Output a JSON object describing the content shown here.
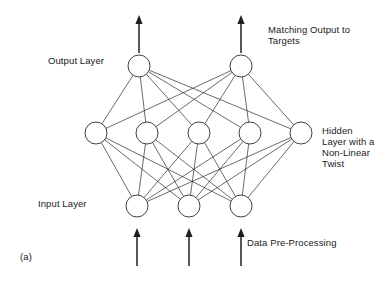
{
  "figure": {
    "caption": "(a)"
  },
  "labels": {
    "output_layer": "Output Layer",
    "input_layer": "Input Layer",
    "matching_output_line1": "Matching Output to",
    "matching_output_line2": "Targets",
    "hidden_line1": "Hidden",
    "hidden_line2": "Layer with a",
    "hidden_line3": "Non-Linear",
    "hidden_line4": "Twist",
    "data_preprocessing": "Data Pre-Processing"
  },
  "colors": {
    "stroke": "#2b2b2b",
    "node_fill": "#ffffff",
    "text": "#1a1a1a",
    "arrow": "#1f1f1f",
    "background": "#ffffff"
  },
  "chart_data": {
    "type": "diagram",
    "node_radius": 11,
    "layers": [
      {
        "name": "output",
        "label": "Output Layer",
        "count": 2,
        "y": 66,
        "x": [
          139,
          241
        ]
      },
      {
        "name": "hidden",
        "label": "Hidden Layer with a Non-Linear Twist",
        "count": 5,
        "y": 133,
        "x": [
          96,
          147,
          199,
          250,
          301
        ]
      },
      {
        "name": "input",
        "label": "Input Layer",
        "count": 3,
        "y": 206,
        "x": [
          137,
          189,
          241
        ]
      }
    ],
    "connections": [
      {
        "from": "input",
        "to": "hidden",
        "pattern": "fully-connected",
        "edges": 15
      },
      {
        "from": "hidden",
        "to": "output",
        "pattern": "fully-connected",
        "edges": 10
      }
    ],
    "arrows": [
      {
        "name": "output-arrow-1",
        "x": 139,
        "y_from": 53,
        "y_to": 15,
        "direction": "up"
      },
      {
        "name": "output-arrow-2",
        "x": 241,
        "y_from": 53,
        "y_to": 15,
        "direction": "up"
      },
      {
        "name": "input-arrow-1",
        "x": 137,
        "y_from": 266,
        "y_to": 228,
        "direction": "up"
      },
      {
        "name": "input-arrow-2",
        "x": 189,
        "y_from": 266,
        "y_to": 228,
        "direction": "up"
      },
      {
        "name": "input-arrow-3",
        "x": 241,
        "y_from": 266,
        "y_to": 228,
        "direction": "up"
      }
    ]
  }
}
